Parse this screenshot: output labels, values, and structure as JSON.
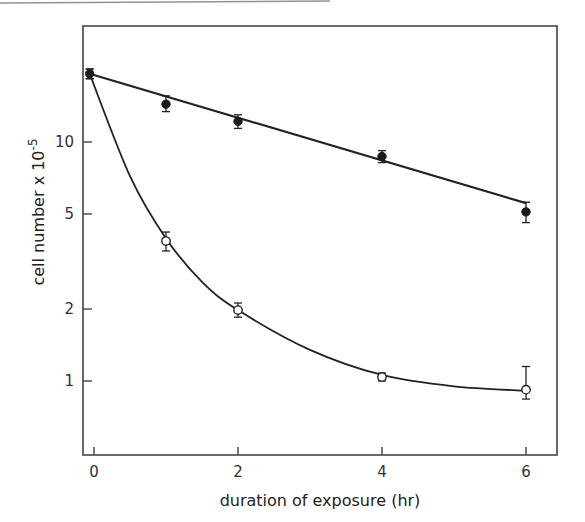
{
  "chart_data": {
    "type": "scatter",
    "title": "",
    "xlabel": "duration of exposure (hr)",
    "ylabel": "cell number x 10",
    "ylabel_exponent": "-5",
    "yscale": "log",
    "xlim": [
      -0.1,
      6.4
    ],
    "ylim": [
      0.49,
      30
    ],
    "grid": false,
    "legend": null,
    "x_ticks": [
      0,
      2,
      4,
      6
    ],
    "x_tick_labels": [
      "0",
      "2",
      "4",
      "6"
    ],
    "y_ticks": [
      1,
      2,
      5,
      10
    ],
    "y_tick_labels": [
      "1",
      "2",
      "5",
      "10"
    ],
    "series": [
      {
        "name": "filled circles",
        "marker": "filled-circle",
        "fit": "linear (log scale)",
        "x": [
          0,
          1,
          2,
          4,
          6
        ],
        "values": [
          19.3,
          14.4,
          12.2,
          8.7,
          5.1
        ],
        "error_low": [
          18.4,
          13.4,
          11.4,
          8.2,
          4.6
        ],
        "error_high": [
          20.2,
          15.6,
          13.0,
          9.2,
          5.6
        ],
        "fit_line": {
          "x": [
            0,
            6
          ],
          "y": [
            19.3,
            5.55
          ]
        }
      },
      {
        "name": "open circles",
        "marker": "open-circle",
        "fit": "smooth curve",
        "x": [
          0,
          1,
          2,
          4,
          6
        ],
        "values": [
          19.3,
          3.85,
          1.98,
          1.04,
          0.92
        ],
        "error_low": [
          18.4,
          3.5,
          1.85,
          1.0,
          0.84
        ],
        "error_high": [
          20.2,
          4.2,
          2.12,
          1.08,
          1.15
        ],
        "fit_curve": {
          "x": [
            0,
            0.5,
            1,
            1.5,
            2,
            3,
            4,
            5,
            6
          ],
          "y": [
            19.3,
            7.2,
            3.95,
            2.6,
            1.98,
            1.35,
            1.06,
            0.95,
            0.91
          ]
        }
      }
    ]
  }
}
